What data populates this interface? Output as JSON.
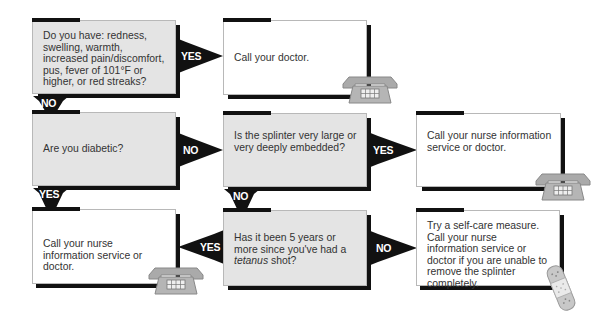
{
  "nodes": {
    "q_symptoms": {
      "text": "Do you have: redness, swelling, warmth, increased pain/discomfort, pus, fever of 101°F or higher, or red streaks?"
    },
    "a_call_doctor": {
      "text": "Call your doctor."
    },
    "q_diabetic": {
      "text": "Are you diabetic?"
    },
    "q_splinter_large": {
      "text": "Is the splinter very large or very deeply embedded?"
    },
    "a_nurse_1": {
      "text": "Call your nurse information service or doctor."
    },
    "a_nurse_2": {
      "text": "Call your nurse information service or doctor."
    },
    "q_tetanus": {
      "text_before": "Has it been 5 years or more since you've had a ",
      "text_em": "tetanus",
      "text_after": " shot?"
    },
    "a_self_care": {
      "text": "Try a self-care measure. Call your nurse information service or doctor if you are unable to remove the splinter completely."
    }
  },
  "edges": {
    "symptoms_yes": "YES",
    "symptoms_no": "NO",
    "diabetic_no": "NO",
    "diabetic_yes": "YES",
    "splinter_yes": "YES",
    "splinter_no": "NO",
    "tetanus_yes": "YES",
    "tetanus_no": "NO"
  },
  "icons": {
    "phone": "telephone-icon",
    "bandage": "bandage-icon"
  },
  "colors": {
    "question_bg": "#e4e4e4",
    "answer_bg": "#ffffff",
    "arrow": "#111111"
  }
}
